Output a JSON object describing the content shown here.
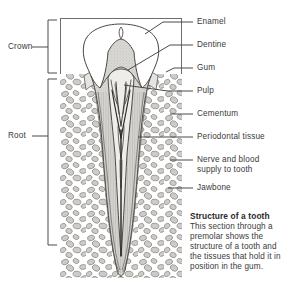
{
  "figure": {
    "title": "Structure of a tooth",
    "description": "This section through a premolar shows the structure of a tooth and the tissues that hold it in position in the gum."
  },
  "right_labels": [
    {
      "id": "enamel",
      "text": "Enamel"
    },
    {
      "id": "dentine",
      "text": "Dentine"
    },
    {
      "id": "gum",
      "text": "Gum"
    },
    {
      "id": "pulp",
      "text": "Pulp"
    },
    {
      "id": "cementum",
      "text": "Cementum"
    },
    {
      "id": "periodontal",
      "text": "Periodontal tissue"
    },
    {
      "id": "nerve-blood",
      "text": "Nerve and blood\nsupply to tooth"
    },
    {
      "id": "jawbone",
      "text": "Jawbone"
    }
  ],
  "left_labels": [
    {
      "id": "crown",
      "text": "Crown"
    },
    {
      "id": "root",
      "text": "Root"
    }
  ],
  "colors": {
    "ink": "#3a3a3a",
    "line": "#4a4a4a",
    "enamel_fill": "#ffffff",
    "dentine_fill": "#d8d6d2",
    "pulp_fill": "#efeeec",
    "bone_fill": "#ffffff",
    "bone_stipple": "#9a9894",
    "caption_title": "#2b2b2b"
  }
}
